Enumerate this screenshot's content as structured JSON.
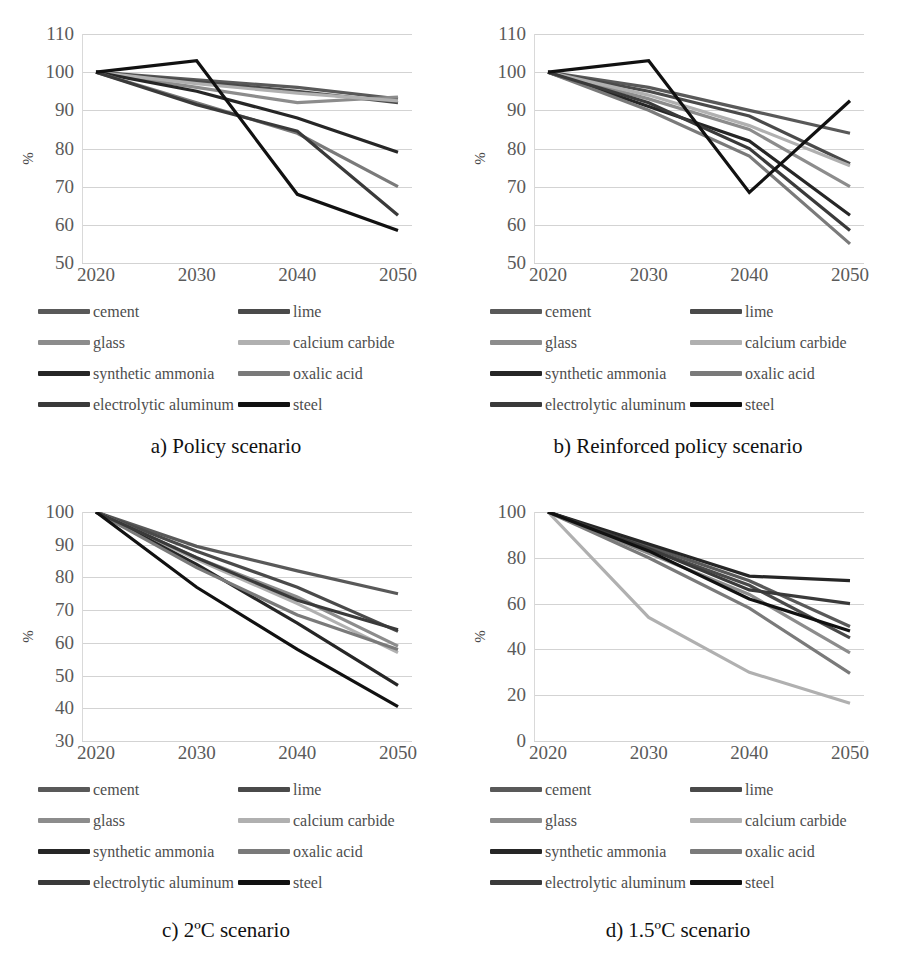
{
  "figure": {
    "series_names": [
      "cement",
      "lime",
      "glass",
      "calcium carbide",
      "synthetic ammonia",
      "oxalic acid",
      "electrolytic aluminum",
      "steel"
    ],
    "series_colors": {
      "cement": "#595959",
      "lime": "#4a4a4a",
      "glass": "#8c8c8c",
      "calcium carbide": "#b0b0b0",
      "synthetic ammonia": "#262626",
      "oxalic acid": "#7a7a7a",
      "electrolytic aluminum": "#3a3a3a",
      "steel": "#111111"
    },
    "legend_layout": [
      [
        "cement",
        "lime"
      ],
      [
        "glass",
        "calcium carbide"
      ],
      [
        "synthetic ammonia",
        "oxalic acid"
      ],
      [
        "electrolytic aluminum",
        "steel"
      ]
    ],
    "ylabel": "%",
    "x": [
      "2020",
      "2030",
      "2040",
      "2050"
    ]
  },
  "chart_data": [
    {
      "type": "line",
      "panel": "a",
      "title": "a) Policy scenario",
      "xlabel": "",
      "ylabel": "%",
      "categories": [
        "2020",
        "2030",
        "2040",
        "2050"
      ],
      "ylim": [
        50,
        110
      ],
      "yticks": [
        50,
        60,
        70,
        80,
        90,
        100,
        110
      ],
      "grid": true,
      "legend_position": "bottom",
      "series": [
        {
          "name": "cement",
          "values": [
            100,
            98,
            96,
            93
          ]
        },
        {
          "name": "lime",
          "values": [
            100,
            97.5,
            95,
            92
          ]
        },
        {
          "name": "glass",
          "values": [
            100,
            96,
            92,
            93.5
          ]
        },
        {
          "name": "calcium carbide",
          "values": [
            100,
            97,
            94.5,
            92.5
          ]
        },
        {
          "name": "synthetic ammonia",
          "values": [
            100,
            95,
            88,
            79
          ]
        },
        {
          "name": "oxalic acid",
          "values": [
            100,
            92,
            84,
            70
          ]
        },
        {
          "name": "electrolytic aluminum",
          "values": [
            100,
            91.5,
            84.5,
            62.5
          ]
        },
        {
          "name": "steel",
          "values": [
            100,
            103,
            68,
            58.5
          ]
        }
      ]
    },
    {
      "type": "line",
      "panel": "b",
      "title": "b) Reinforced policy scenario",
      "xlabel": "",
      "ylabel": "%",
      "categories": [
        "2020",
        "2030",
        "2040",
        "2050"
      ],
      "ylim": [
        50,
        110
      ],
      "yticks": [
        50,
        60,
        70,
        80,
        90,
        100,
        110
      ],
      "grid": true,
      "legend_position": "bottom",
      "series": [
        {
          "name": "cement",
          "values": [
            100,
            96,
            90,
            84
          ]
        },
        {
          "name": "lime",
          "values": [
            100,
            95,
            88.5,
            76
          ]
        },
        {
          "name": "glass",
          "values": [
            100,
            93,
            85,
            70
          ]
        },
        {
          "name": "calcium carbide",
          "values": [
            100,
            94,
            86,
            75.5
          ]
        },
        {
          "name": "synthetic ammonia",
          "values": [
            100,
            91,
            82,
            62.5
          ]
        },
        {
          "name": "oxalic acid",
          "values": [
            100,
            90,
            78,
            55
          ]
        },
        {
          "name": "electrolytic aluminum",
          "values": [
            100,
            92,
            80,
            58.5
          ]
        },
        {
          "name": "steel",
          "values": [
            100,
            103,
            68.5,
            92.5
          ]
        }
      ]
    },
    {
      "type": "line",
      "panel": "c",
      "title": "c) 2ºC scenario",
      "xlabel": "",
      "ylabel": "%",
      "categories": [
        "2020",
        "2030",
        "2040",
        "2050"
      ],
      "ylim": [
        30,
        100
      ],
      "yticks": [
        30,
        40,
        50,
        60,
        70,
        80,
        90,
        100
      ],
      "grid": true,
      "legend_position": "bottom",
      "series": [
        {
          "name": "cement",
          "values": [
            100,
            89.5,
            82,
            75
          ]
        },
        {
          "name": "lime",
          "values": [
            100,
            88,
            77,
            63.5
          ]
        },
        {
          "name": "glass",
          "values": [
            100,
            86,
            74,
            59
          ]
        },
        {
          "name": "calcium carbide",
          "values": [
            100,
            85.5,
            72,
            57
          ]
        },
        {
          "name": "synthetic ammonia",
          "values": [
            100,
            84,
            66,
            47
          ]
        },
        {
          "name": "oxalic acid",
          "values": [
            100,
            83,
            68.5,
            58
          ]
        },
        {
          "name": "electrolytic aluminum",
          "values": [
            100,
            86,
            73,
            64
          ]
        },
        {
          "name": "steel",
          "values": [
            100,
            77,
            58,
            40.5
          ]
        }
      ]
    },
    {
      "type": "line",
      "panel": "d",
      "title": "d) 1.5ºC scenario",
      "xlabel": "",
      "ylabel": "%",
      "categories": [
        "2020",
        "2030",
        "2040",
        "2050"
      ],
      "ylim": [
        0,
        100
      ],
      "yticks": [
        0,
        20,
        40,
        60,
        80,
        100
      ],
      "grid": true,
      "legend_position": "bottom",
      "series": [
        {
          "name": "cement",
          "values": [
            100,
            85,
            70,
            50
          ]
        },
        {
          "name": "lime",
          "values": [
            100,
            84,
            68,
            45
          ]
        },
        {
          "name": "glass",
          "values": [
            100,
            82,
            64,
            38.5
          ]
        },
        {
          "name": "calcium carbide",
          "values": [
            100,
            54,
            30,
            16.5
          ]
        },
        {
          "name": "synthetic ammonia",
          "values": [
            100,
            86,
            72,
            70
          ]
        },
        {
          "name": "oxalic acid",
          "values": [
            100,
            80,
            58,
            29.5
          ]
        },
        {
          "name": "electrolytic aluminum",
          "values": [
            100,
            84,
            66,
            60
          ]
        },
        {
          "name": "steel",
          "values": [
            100,
            83,
            62,
            48
          ]
        }
      ]
    }
  ]
}
